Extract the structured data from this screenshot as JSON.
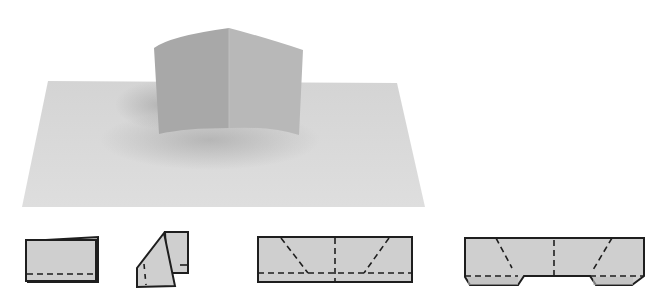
{
  "figure": {
    "colors": {
      "background": "#ffffff",
      "sheet_light": "#d9d9d9",
      "sheet_shadow": "#b8b8b8",
      "popup_left": "#a9a9a9",
      "popup_right": "#b6b6b6",
      "diagram_fill": "#cfcfcf",
      "diagram_stroke": "#1e1e1e"
    },
    "photo": {
      "label": "Finished pop-up photo"
    },
    "steps": [
      {
        "index": 1,
        "label": "Fold card in half, crease along dashed line"
      },
      {
        "index": 2,
        "label": "Fold corner diagonally"
      },
      {
        "index": 3,
        "label": "Unfolded strip with crease lines"
      },
      {
        "index": 4,
        "label": "Cut tabs and fold along dashed lines"
      }
    ]
  }
}
